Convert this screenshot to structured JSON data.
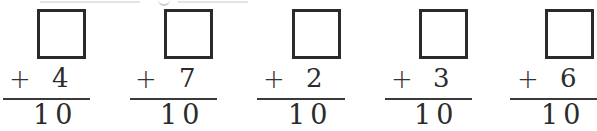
{
  "worksheet": {
    "operator": "+",
    "problems": [
      {
        "addend": "4",
        "sum": "10",
        "answer": ""
      },
      {
        "addend": "7",
        "sum": "10",
        "answer": ""
      },
      {
        "addend": "2",
        "sum": "10",
        "answer": ""
      },
      {
        "addend": "3",
        "sum": "10",
        "answer": ""
      },
      {
        "addend": "6",
        "sum": "10",
        "answer": ""
      }
    ]
  }
}
